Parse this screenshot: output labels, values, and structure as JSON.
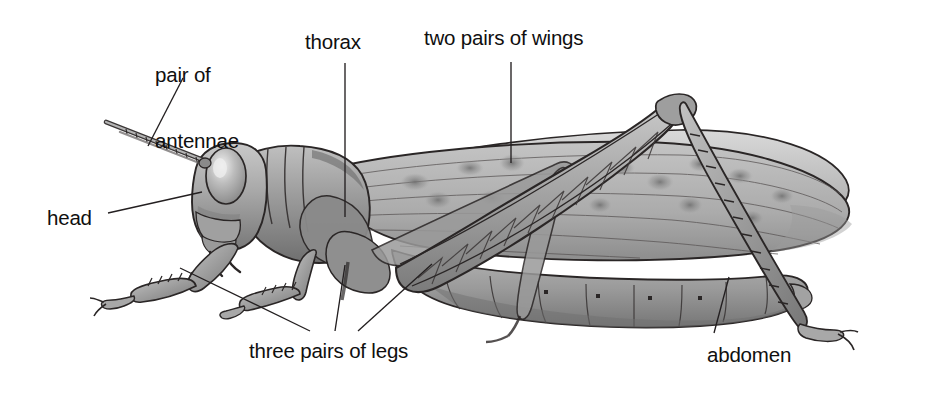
{
  "figure": {
    "style": "grayscale pencil illustration",
    "background_color": "#ffffff",
    "line_color": "#231f20",
    "text_color": "#100f0f"
  },
  "labels": [
    {
      "id": "pair-of-antennae",
      "line1": "pair of",
      "line2": "antennae",
      "x": 155,
      "y": 20,
      "align": "center"
    },
    {
      "id": "thorax",
      "line1": "thorax",
      "line2": "",
      "x": 305,
      "y": 31,
      "align": "left"
    },
    {
      "id": "two-pairs-of-wings",
      "line1": "two pairs of wings",
      "line2": "",
      "x": 424,
      "y": 27,
      "align": "left"
    },
    {
      "id": "head",
      "line1": "head",
      "line2": "",
      "x": 47,
      "y": 207,
      "align": "left"
    },
    {
      "id": "three-pairs-of-legs",
      "line1": "three pairs of legs",
      "line2": "",
      "x": 249,
      "y": 340,
      "align": "left"
    },
    {
      "id": "abdomen",
      "line1": "abdomen",
      "line2": "",
      "x": 707,
      "y": 344,
      "align": "left"
    }
  ],
  "leader_lines": [
    {
      "id": "leader-antennae",
      "x1": 183,
      "y1": 78,
      "x2": 148,
      "y2": 146
    },
    {
      "id": "leader-thorax",
      "x1": 345,
      "y1": 63,
      "x2": 345,
      "y2": 217
    },
    {
      "id": "leader-wings",
      "x1": 511,
      "y1": 62,
      "x2": 511,
      "y2": 163
    },
    {
      "id": "leader-head",
      "x1": 108,
      "y1": 213,
      "x2": 202,
      "y2": 192
    },
    {
      "id": "leader-leg-front",
      "x1": 180,
      "y1": 268,
      "x2": 310,
      "y2": 331
    },
    {
      "id": "leader-leg-mid",
      "x1": 345,
      "y1": 265,
      "x2": 335,
      "y2": 331
    },
    {
      "id": "leader-leg-hind",
      "x1": 432,
      "y1": 264,
      "x2": 358,
      "y2": 331
    },
    {
      "id": "leader-abdomen",
      "x1": 729,
      "y1": 277,
      "x2": 714,
      "y2": 333
    }
  ],
  "anatomy_parts": [
    "head",
    "pair of antennae",
    "thorax",
    "two pairs of wings",
    "three pairs of legs",
    "abdomen"
  ]
}
